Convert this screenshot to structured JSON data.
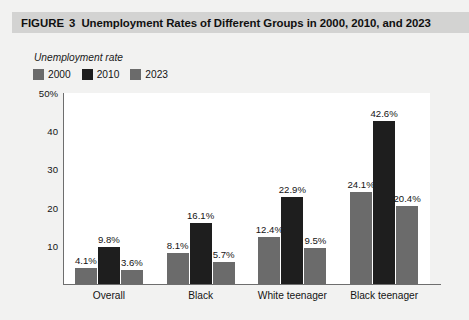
{
  "figure": {
    "label": "FIGURE",
    "number": "3",
    "title": "Unemployment Rates of Different Groups in 2000, 2010, and 2023"
  },
  "colors": {
    "series_2000": "#6b6b6b",
    "series_2010": "#1e1e1e",
    "series_2023": "#6b6b6b",
    "title_bar": "#d3d3d2",
    "page_background": "#f2f2f1",
    "plot_background": "#ffffff",
    "axis": "#6e6e6e",
    "text": "#141414"
  },
  "chart_data": {
    "type": "bar",
    "title": "Unemployment Rates of Different Groups in 2000, 2010, and 2023",
    "ylabel": "Unemployment rate",
    "xlabel": "",
    "categories": [
      "Overall",
      "Black",
      "White teenager",
      "Black teenager"
    ],
    "series": [
      {
        "name": "2000",
        "color": "#6b6b6b",
        "values": [
          4.1,
          8.1,
          12.4,
          24.1
        ],
        "labels": [
          "4.1%",
          "8.1%",
          "12.4%",
          "24.1%"
        ]
      },
      {
        "name": "2010",
        "color": "#1e1e1e",
        "values": [
          9.8,
          16.1,
          22.9,
          42.6
        ],
        "labels": [
          "9.8%",
          "16.1%",
          "22.9%",
          "42.6%"
        ]
      },
      {
        "name": "2023",
        "color": "#6b6b6b",
        "values": [
          3.6,
          5.7,
          9.5,
          20.4
        ],
        "labels": [
          "3.6%",
          "5.7%",
          "9.5%",
          "20.4%"
        ]
      }
    ],
    "ylim": [
      0,
      50
    ],
    "yticks": [
      10,
      20,
      30,
      40,
      50
    ],
    "ytick_labels": [
      "10",
      "20",
      "30",
      "40",
      "50%"
    ],
    "grid": false,
    "legend_position": "top-left"
  }
}
